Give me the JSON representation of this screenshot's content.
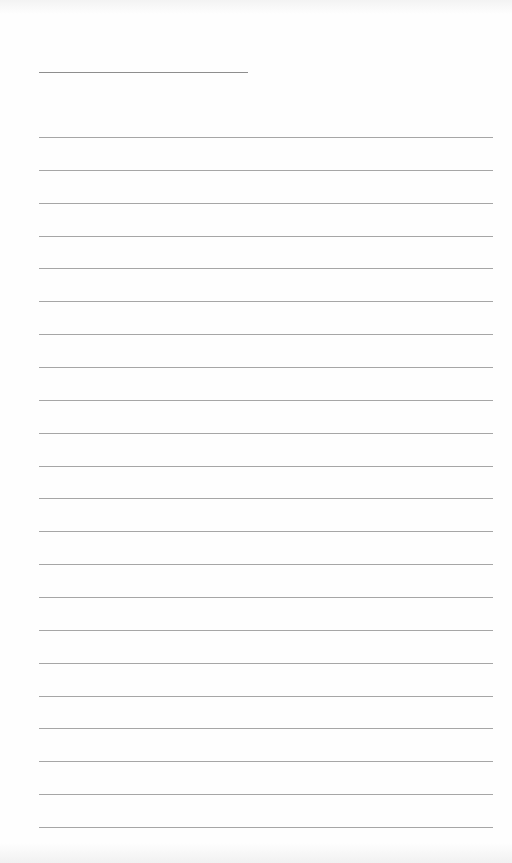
{
  "document": {
    "type": "blank lined writing sheet",
    "title_line": {
      "x": 39,
      "y": 72,
      "width": 209
    },
    "rules": {
      "count": 22,
      "x": 39,
      "width": 454,
      "first_y": 137,
      "spacing": 32.86
    },
    "colors": {
      "paper": "#fefefe",
      "title_line": "#8e8e8e",
      "rule_line": "#a6a6a6"
    }
  }
}
